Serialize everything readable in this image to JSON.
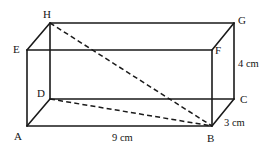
{
  "figure": {
    "kind": "cuboid-diagram",
    "shape_name": "rectangular prism ABCDEFGH",
    "stroke_color": "#1a1a1a",
    "background_color": "#ffffff",
    "vertices": [
      {
        "id": "A",
        "label": "A",
        "x": 27,
        "y": 126,
        "label_x": 14,
        "label_y": 140,
        "role": "front-bottom-left"
      },
      {
        "id": "B",
        "label": "B",
        "x": 212,
        "y": 126,
        "label_x": 207,
        "label_y": 142,
        "role": "front-bottom-right"
      },
      {
        "id": "C",
        "label": "C",
        "x": 234,
        "y": 99,
        "label_x": 240,
        "label_y": 103,
        "role": "back-bottom-right"
      },
      {
        "id": "D",
        "label": "D",
        "x": 50,
        "y": 99,
        "label_x": 37,
        "label_y": 97,
        "role": "back-bottom-left"
      },
      {
        "id": "E",
        "label": "E",
        "x": 27,
        "y": 50,
        "label_x": 13,
        "label_y": 53,
        "role": "front-top-left"
      },
      {
        "id": "F",
        "label": "F",
        "x": 212,
        "y": 50,
        "label_x": 215,
        "label_y": 54,
        "role": "front-top-right"
      },
      {
        "id": "G",
        "label": "G",
        "x": 234,
        "y": 23,
        "label_x": 238,
        "label_y": 24,
        "role": "back-top-right"
      },
      {
        "id": "H",
        "label": "H",
        "x": 50,
        "y": 23,
        "label_x": 43,
        "label_y": 18,
        "role": "back-top-left"
      }
    ],
    "solid_edges": [
      {
        "name": "edge-A-B",
        "from": "A",
        "to": "B"
      },
      {
        "name": "edge-B-F",
        "from": "B",
        "to": "F"
      },
      {
        "name": "edge-F-E",
        "from": "F",
        "to": "E"
      },
      {
        "name": "edge-E-A",
        "from": "E",
        "to": "A"
      },
      {
        "name": "edge-E-H",
        "from": "E",
        "to": "H"
      },
      {
        "name": "edge-H-G",
        "from": "H",
        "to": "G"
      },
      {
        "name": "edge-G-F",
        "from": "G",
        "to": "F"
      },
      {
        "name": "edge-G-C",
        "from": "G",
        "to": "C"
      },
      {
        "name": "edge-C-B",
        "from": "C",
        "to": "B"
      },
      {
        "name": "edge-D-C",
        "from": "D",
        "to": "C"
      },
      {
        "name": "edge-D-H",
        "from": "D",
        "to": "H"
      },
      {
        "name": "edge-D-A",
        "from": "D",
        "to": "A"
      }
    ],
    "dashed_lines": [
      {
        "name": "diagonal-H-B",
        "from": "H",
        "to": "B",
        "kind": "space-diagonal"
      },
      {
        "name": "diagonal-D-B",
        "from": "D",
        "to": "B",
        "kind": "base-diagonal"
      }
    ],
    "dimensions": [
      {
        "name": "length-label",
        "text": "9 cm",
        "value": 9,
        "unit": "cm",
        "edge": "AB",
        "x": 112,
        "y": 141
      },
      {
        "name": "height-label",
        "text": "4 cm",
        "value": 4,
        "unit": "cm",
        "edge": "CG",
        "x": 238,
        "y": 67
      },
      {
        "name": "depth-label",
        "text": "3 cm",
        "value": 3,
        "unit": "cm",
        "edge": "BC",
        "x": 224,
        "y": 126
      }
    ]
  }
}
